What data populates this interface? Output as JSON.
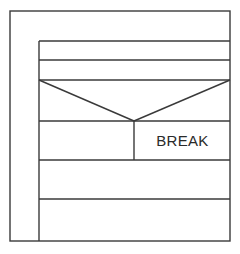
{
  "diagram": {
    "type": "nassi-shneiderman structogram",
    "outer_block": {
      "label": ""
    },
    "inner_block": {
      "rows": [
        {
          "kind": "statement",
          "label": ""
        },
        {
          "kind": "statement",
          "label": ""
        },
        {
          "kind": "decision",
          "condition": "",
          "left_branch": "",
          "right_branch": "BREAK"
        },
        {
          "kind": "statement",
          "label": ""
        },
        {
          "kind": "statement",
          "label": ""
        }
      ]
    },
    "break_label": "BREAK",
    "stroke_color": "#3a3a3a",
    "background": "#ffffff"
  }
}
